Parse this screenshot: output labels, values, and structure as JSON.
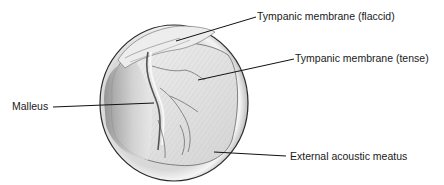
{
  "figure": {
    "labels": [
      {
        "id": "flaccid",
        "text": "Tympanic membrane (flaccid)"
      },
      {
        "id": "tense",
        "text": "Tympanic membrane (tense)"
      },
      {
        "id": "malleus",
        "text": "Malleus"
      },
      {
        "id": "meatus",
        "text": "External acoustic meatus"
      }
    ],
    "colors": {
      "outline": "#2a2a2a",
      "membrane": "#e6e6e6",
      "shadow": "#9a9a9a",
      "rim": "#f2f2f2",
      "leader": "#111111"
    }
  }
}
